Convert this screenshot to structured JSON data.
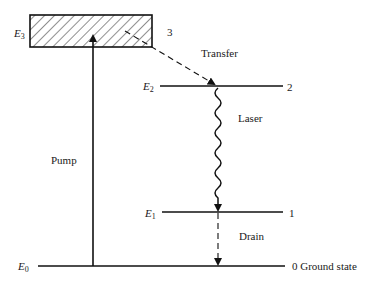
{
  "diagram": {
    "type": "four-level laser energy diagram",
    "levels": [
      {
        "symbol": "E",
        "sub": "3",
        "number": "3"
      },
      {
        "symbol": "E",
        "sub": "2",
        "number": "2"
      },
      {
        "symbol": "E",
        "sub": "1",
        "number": "1"
      },
      {
        "symbol": "E",
        "sub": "0",
        "number": "0 Ground state"
      }
    ],
    "transitions": {
      "pump": "Pump",
      "transfer": "Transfer",
      "laser": "Laser",
      "drain": "Drain"
    }
  }
}
